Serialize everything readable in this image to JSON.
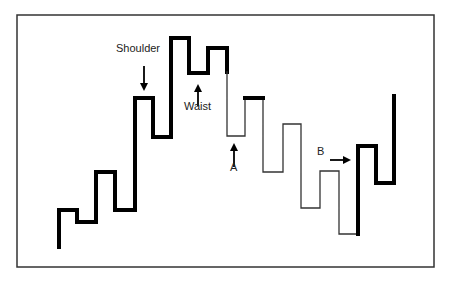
{
  "diagram": {
    "title": "",
    "colors": {
      "line": "#000000",
      "thin_line": "#333333",
      "border": "#333333",
      "background": "#ffffff"
    },
    "frame": {
      "x": 17,
      "y": 15,
      "w": 417,
      "h": 252
    },
    "segments": [
      {
        "name": "uptrend-thick",
        "width": 4,
        "points": [
          [
            59,
            247
          ],
          [
            59,
            210
          ],
          [
            77,
            210
          ],
          [
            77,
            222
          ],
          [
            96,
            222
          ],
          [
            96,
            172
          ],
          [
            115,
            172
          ],
          [
            115,
            210
          ],
          [
            135,
            210
          ],
          [
            135,
            98
          ],
          [
            153,
            98
          ],
          [
            153,
            137
          ],
          [
            171,
            137
          ],
          [
            171,
            38
          ],
          [
            189,
            38
          ],
          [
            189,
            73
          ],
          [
            208,
            73
          ],
          [
            208,
            48
          ],
          [
            227,
            48
          ],
          [
            227,
            72
          ]
        ]
      },
      {
        "name": "downtrend-thin",
        "width": 1.3,
        "points": [
          [
            227,
            72
          ],
          [
            227,
            136
          ],
          [
            245,
            136
          ],
          [
            245,
            98
          ],
          [
            263,
            98
          ],
          [
            263,
            172
          ],
          [
            283,
            172
          ],
          [
            283,
            124
          ],
          [
            301,
            124
          ],
          [
            301,
            208
          ],
          [
            320,
            208
          ],
          [
            320,
            171
          ],
          [
            339,
            171
          ],
          [
            339,
            234
          ],
          [
            358,
            234
          ]
        ]
      },
      {
        "name": "thick-accent-top",
        "width": 4,
        "points": [
          [
            245,
            98
          ],
          [
            263,
            98
          ]
        ]
      },
      {
        "name": "reversal-thick",
        "width": 4,
        "points": [
          [
            358,
            234
          ],
          [
            358,
            146
          ],
          [
            376,
            146
          ],
          [
            376,
            183
          ],
          [
            394,
            183
          ],
          [
            394,
            96
          ]
        ]
      }
    ],
    "annotations": [
      {
        "id": "shoulder",
        "text": "Shoulder",
        "label_x": 116,
        "label_y": 52,
        "arrow": {
          "x": 144,
          "from_y": 66,
          "to_y": 91,
          "dir": "down"
        }
      },
      {
        "id": "waist",
        "text": "Waist",
        "label_x": 184,
        "label_y": 110,
        "arrow": {
          "x": 198,
          "from_y": 106,
          "to_y": 84,
          "dir": "up"
        }
      },
      {
        "id": "a",
        "text": "A",
        "label_x": 230,
        "label_y": 171,
        "arrow": {
          "x": 234,
          "from_y": 167,
          "to_y": 143,
          "dir": "up"
        }
      },
      {
        "id": "b",
        "text": "B",
        "label_x": 317,
        "label_y": 155,
        "arrow": {
          "y": 160,
          "from_x": 330,
          "to_x": 351,
          "dir": "right"
        }
      }
    ]
  }
}
